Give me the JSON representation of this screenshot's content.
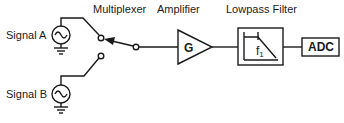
{
  "diagram": {
    "type": "signal-chain block diagram",
    "sources": [
      {
        "label": "Signal A",
        "icon": "ac-source-icon"
      },
      {
        "label": "Signal B",
        "icon": "ac-source-icon"
      }
    ],
    "stages": {
      "multiplexer": {
        "label": "Multiplexer",
        "selected_input": "Signal A"
      },
      "amplifier": {
        "label": "Amplifier",
        "symbol": "G"
      },
      "filter": {
        "label": "Lowpass Filter",
        "cutoff_symbol": "f",
        "cutoff_subscript": "1"
      },
      "adc": {
        "label": "ADC"
      }
    },
    "colors": {
      "line": "#1a1a1a",
      "background": "#ffffff"
    }
  }
}
